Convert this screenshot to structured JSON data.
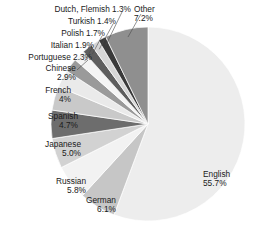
{
  "chart_data": {
    "type": "pie",
    "title": "INTERNET SOFTWARE BY LANGUAGE",
    "xlabel": "",
    "ylabel": "",
    "legend_position": "callout-labels",
    "grid": false,
    "units": "percent",
    "start_angle_deg": 0,
    "direction": "clockwise",
    "categories": [
      "English",
      "German",
      "Russian",
      "Japanese",
      "Spanish",
      "French",
      "Chinese",
      "Portuguese",
      "Italian",
      "Polish",
      "Turkish",
      "Dutch, Flemish",
      "Other"
    ],
    "values": [
      55.7,
      6.1,
      5.8,
      5.0,
      4.7,
      4.0,
      2.9,
      2.3,
      1.9,
      1.7,
      1.4,
      1.3,
      7.2
    ],
    "value_labels": [
      "55.7%",
      "6.1%",
      "5.8%",
      "5.0%",
      "4.7%",
      "4%",
      "2.9%",
      "2.3%",
      "1.9%",
      "1.7%",
      "1.4%",
      "1.3%",
      "7.2%"
    ],
    "colors": [
      "#ededed",
      "#c6c6c6",
      "#f2f2f2",
      "#d2d2d2",
      "#6d6d6d",
      "#c9c9c9",
      "#eaeaea",
      "#9a9a9a",
      "#f4f4f4",
      "#5e5e5e",
      "#d6d6d6",
      "#3a3a3a",
      "#8f8f8f"
    ],
    "slice_label_text": [
      "English\n55.7%",
      "German\n6.1%",
      "Russian\n5.8%",
      "Japanese\n5.0%",
      "Spanish\n4.7%",
      "French\n4%",
      "Chinese\n2.9%",
      "Portuguese 2.3%",
      "Italian 1.9%",
      "Polish 1.7%",
      "Turkish 1.4%",
      "Dutch, Flemish 1.3%",
      "Other\n7.2%"
    ]
  },
  "labels": {
    "english": {
      "name": "English",
      "value": "55.7%"
    },
    "german": {
      "name": "German",
      "value": "6.1%"
    },
    "russian": {
      "name": "Russian",
      "value": "5.8%"
    },
    "japanese": {
      "name": "Japanese",
      "value": "5.0%"
    },
    "spanish": {
      "name": "Spanish",
      "value": "4.7%"
    },
    "french": {
      "name": "French",
      "value": "4%"
    },
    "chinese": {
      "name": "Chinese",
      "value": "2.9%"
    },
    "portuguese": {
      "name": "Portuguese 2.3%"
    },
    "italian": {
      "name": "Italian 1.9%"
    },
    "polish": {
      "name": "Polish 1.7%"
    },
    "turkish": {
      "name": "Turkish 1.4%"
    },
    "dutch_flemish": {
      "name": "Dutch, Flemish 1.3%"
    },
    "other": {
      "name": "Other",
      "value": "7.2%"
    }
  },
  "title": "INTERNET SOFTWARE BY LANGUAGE"
}
